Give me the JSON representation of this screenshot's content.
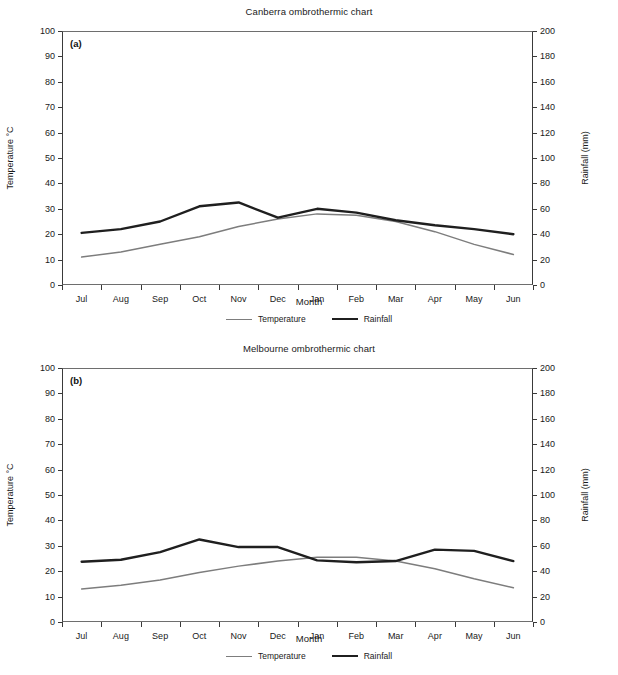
{
  "charts": [
    {
      "panel": "(a)",
      "title": "Canberra ombrothermic chart",
      "xlabel": "Month",
      "ylabel_left": "Temperature °C",
      "ylabel_right": "Rainfall (mm)",
      "legend": [
        {
          "label": "Temperature",
          "color": "#7d7d7d"
        },
        {
          "label": "Rainfall",
          "color": "#1f1f1f"
        }
      ],
      "chart_data": {
        "type": "line",
        "title": "Canberra ombrothermic chart",
        "xlabel": "Month",
        "ylabel": "Temperature °C",
        "ylabel_secondary": "Rainfall (mm)",
        "categories": [
          "Jul",
          "Aug",
          "Sep",
          "Oct",
          "Nov",
          "Dec",
          "Jan",
          "Feb",
          "Mar",
          "Apr",
          "May",
          "Jun"
        ],
        "ylim": [
          0,
          100
        ],
        "yticks": [
          0,
          10,
          20,
          30,
          40,
          50,
          60,
          70,
          80,
          90,
          100
        ],
        "ylim_secondary": [
          0,
          200
        ],
        "yticks_secondary": [
          0,
          20,
          40,
          60,
          80,
          100,
          120,
          140,
          160,
          180,
          200
        ],
        "grid": false,
        "legend_position": "bottom",
        "series": [
          {
            "name": "Temperature",
            "axis": "left",
            "unit": "°C",
            "values": [
              11,
              13,
              16,
              19,
              23,
              26,
              28,
              27.5,
              25,
              21,
              16,
              12
            ]
          },
          {
            "name": "Rainfall",
            "axis": "right",
            "unit": "mm",
            "values": [
              41,
              44,
              50,
              62,
              65,
              53,
              60,
              57,
              51,
              47,
              44,
              40
            ]
          }
        ]
      }
    },
    {
      "panel": "(b)",
      "title": "Melbourne ombrothermic chart",
      "xlabel": "Month",
      "ylabel_left": "Temperature °C",
      "ylabel_right": "Rainfall (mm)",
      "legend": [
        {
          "label": "Temperature",
          "color": "#7d7d7d"
        },
        {
          "label": "Rainfall",
          "color": "#1f1f1f"
        }
      ],
      "chart_data": {
        "type": "line",
        "title": "Melbourne ombrothermic chart",
        "xlabel": "Month",
        "ylabel": "Temperature °C",
        "ylabel_secondary": "Rainfall (mm)",
        "categories": [
          "Jul",
          "Aug",
          "Sep",
          "Oct",
          "Nov",
          "Dec",
          "Jan",
          "Feb",
          "Mar",
          "Apr",
          "May",
          "Jun"
        ],
        "ylim": [
          0,
          100
        ],
        "yticks": [
          0,
          10,
          20,
          30,
          40,
          50,
          60,
          70,
          80,
          90,
          100
        ],
        "ylim_secondary": [
          0,
          200
        ],
        "yticks_secondary": [
          0,
          20,
          40,
          60,
          80,
          100,
          120,
          140,
          160,
          180,
          200
        ],
        "grid": false,
        "legend_position": "bottom",
        "series": [
          {
            "name": "Temperature",
            "axis": "left",
            "unit": "°C",
            "values": [
              13,
              14.5,
              16.5,
              19.5,
              22,
              24,
              25.5,
              25.5,
              24,
              21,
              17,
              13.5
            ]
          },
          {
            "name": "Rainfall",
            "axis": "right",
            "unit": "mm",
            "values": [
              47.5,
              49,
              55,
              65,
              59,
              59,
              48.5,
              47,
              48,
              57,
              56,
              48
            ]
          }
        ]
      }
    }
  ]
}
